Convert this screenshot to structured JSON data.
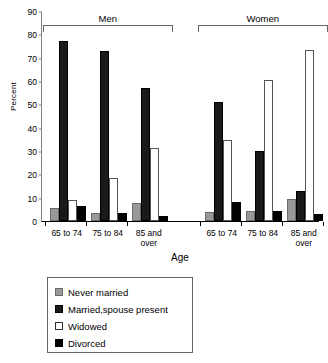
{
  "chart_data": {
    "type": "bar",
    "title": "",
    "xlabel": "Age",
    "ylabel": "Percent",
    "ylim": [
      0,
      90
    ],
    "ytick_step": 10,
    "yticks": [
      0,
      10,
      20,
      30,
      40,
      50,
      60,
      70,
      80,
      90
    ],
    "grid": false,
    "legend_position": "below-left",
    "group_headers": [
      "Men",
      "Women"
    ],
    "categories": [
      "65 to 74",
      "75 to 84",
      "85 and over",
      "65 to 74",
      "75 to 84",
      "85 and over"
    ],
    "series": [
      {
        "name": "Never married",
        "color": "#999999",
        "values": [
          5.4,
          3.6,
          7.8,
          3.8,
          4.4,
          9.3
        ]
      },
      {
        "name": "Married,spouse present",
        "color": "#1a1a1a",
        "values": [
          77.2,
          73.0,
          57.0,
          51.2,
          29.8,
          12.8
        ]
      },
      {
        "name": "Widowed",
        "color": "#ffffff",
        "values": [
          9.2,
          18.3,
          31.4,
          34.7,
          60.3,
          73.1
        ]
      },
      {
        "name": "Divorced",
        "color": "#000000",
        "values": [
          6.4,
          3.6,
          2.0,
          8.2,
          4.2,
          2.9
        ]
      }
    ],
    "groups": [
      {
        "group": "Men",
        "bars": [
          {
            "category": "65 to 74",
            "Never married": 5.4,
            "Married,spouse present": 77.2,
            "Widowed": 9.2,
            "Divorced": 6.4
          },
          {
            "category": "75 to 84",
            "Never married": 3.6,
            "Married,spouse present": 73.0,
            "Widowed": 18.3,
            "Divorced": 3.6
          },
          {
            "category": "85 and over",
            "Never married": 7.8,
            "Married,spouse present": 57.0,
            "Widowed": 31.4,
            "Divorced": 2.0
          }
        ]
      },
      {
        "group": "Women",
        "bars": [
          {
            "category": "65 to 74",
            "Never married": 3.8,
            "Married,spouse present": 51.2,
            "Widowed": 34.7,
            "Divorced": 8.2
          },
          {
            "category": "75 to 84",
            "Never married": 4.4,
            "Married,spouse present": 29.8,
            "Widowed": 60.3,
            "Divorced": 4.2
          },
          {
            "category": "85 and over",
            "Never married": 9.3,
            "Married,spouse present": 12.8,
            "Widowed": 73.1,
            "Divorced": 2.9
          }
        ]
      }
    ]
  },
  "axis": {
    "ylabel": "Percent",
    "xlabel": "Age",
    "yticks": [
      "0",
      "10",
      "20",
      "30",
      "40",
      "50",
      "60",
      "70",
      "80",
      "90"
    ]
  },
  "brackets": [
    {
      "label": "Men"
    },
    {
      "label": "Women"
    }
  ],
  "xticks": [
    {
      "line1": "65 to 74",
      "line2": ""
    },
    {
      "line1": "75 to 84",
      "line2": ""
    },
    {
      "line1": "85 and",
      "line2": "over"
    },
    {
      "line1": "65 to 74",
      "line2": ""
    },
    {
      "line1": "75 to 84",
      "line2": ""
    },
    {
      "line1": "85 and",
      "line2": "over"
    }
  ],
  "legend": {
    "items": [
      {
        "label": "Never married"
      },
      {
        "label": "Married,spouse present"
      },
      {
        "label": "Widowed"
      },
      {
        "label": "Divorced"
      }
    ]
  }
}
